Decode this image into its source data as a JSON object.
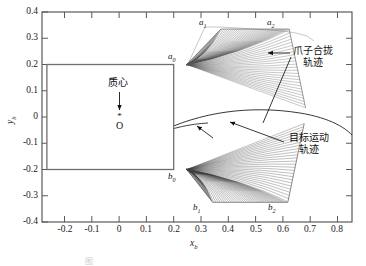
{
  "figure": {
    "caption": "图",
    "axes": {
      "xlabel": "x",
      "xlabel_sub": "b",
      "ylabel": "y",
      "ylabel_sub": "b",
      "xticks": [
        "-0.2",
        "-0.1",
        "0",
        "0.1",
        "0.2",
        "0.3",
        "0.4",
        "0.5",
        "0.6",
        "0.7",
        "0.8"
      ],
      "yticks": [
        "0.4",
        "0.3",
        "0.2",
        "0.1",
        "0",
        "-0.1",
        "-0.2",
        "-0.3",
        "-0.4"
      ],
      "xlim": [
        -0.28,
        0.855
      ],
      "ylim": [
        -0.4,
        0.4
      ],
      "frame_color": "#555555",
      "grid": false
    },
    "corner_labels": [
      {
        "name": "a0",
        "base": "a",
        "sub": "0",
        "x": 0.238,
        "y": 0.222
      },
      {
        "name": "a1",
        "base": "a",
        "sub": "1",
        "x": 0.355,
        "y": 0.352
      },
      {
        "name": "a2",
        "base": "a",
        "sub": "2",
        "x": 0.605,
        "y": 0.352
      },
      {
        "name": "b0",
        "base": "b",
        "sub": "0",
        "x": 0.238,
        "y": -0.238
      },
      {
        "name": "b1",
        "base": "b",
        "sub": "1",
        "x": 0.327,
        "y": -0.345
      },
      {
        "name": "b2",
        "base": "b",
        "sub": "2",
        "x": 0.598,
        "y": -0.345
      }
    ],
    "annotations": [
      {
        "name": "claw-closing-trajectory",
        "line1": "爪子合拢",
        "line2": "轨迹",
        "color": "#111111"
      },
      {
        "name": "target-motion-trajectory",
        "line1": "目标运动",
        "line2": "轨迹",
        "color": "#111111"
      },
      {
        "name": "center-of-mass",
        "line1": "质心",
        "line2": "",
        "color": "#111111"
      }
    ],
    "origin_marker": {
      "label": "O",
      "glyph": "*",
      "x": 0.0,
      "y": 0.0
    },
    "body_rect": {
      "name": "payload-body-rectangle",
      "x0": -0.25,
      "x1": 0.25,
      "y0": -0.2,
      "y1": 0.2,
      "stroke": "#6b6b6b"
    }
  },
  "chart_data": {
    "type": "line",
    "title": "",
    "subtitle": "",
    "xlabel": "x_b",
    "ylabel": "y_b",
    "xlim": [
      -0.28,
      0.855
    ],
    "ylim": [
      -0.4,
      0.4
    ],
    "xticks": [
      -0.2,
      -0.1,
      0,
      0.1,
      0.2,
      0.3,
      0.4,
      0.5,
      0.6,
      0.7,
      0.8
    ],
    "yticks": [
      -0.4,
      -0.3,
      -0.2,
      -0.1,
      0,
      0.1,
      0.2,
      0.3,
      0.4
    ],
    "grid": false,
    "legend": "none",
    "series": [
      {
        "name": "payload-body-rectangle",
        "type": "rectangle",
        "x": [
          -0.25,
          0.25,
          0.25,
          -0.25,
          -0.25
        ],
        "y": [
          0.2,
          0.2,
          -0.2,
          -0.2,
          0.2
        ],
        "color": "#6b6b6b"
      },
      {
        "name": "upper-claw-closing-surface",
        "type": "ruled-surface",
        "anchor_points": [
          {
            "label": "a0",
            "x": 0.25,
            "y": 0.2
          },
          {
            "label": "a1",
            "x": 0.375,
            "y": 0.335
          },
          {
            "label": "a2",
            "x": 0.625,
            "y": 0.335
          }
        ],
        "fan_origin": {
          "x": 0.25,
          "y": 0.2
        },
        "line_count": 90,
        "color": "#3a3a3a"
      },
      {
        "name": "lower-claw-closing-surface",
        "type": "ruled-surface",
        "anchor_points": [
          {
            "label": "b0",
            "x": 0.25,
            "y": -0.2
          },
          {
            "label": "b1",
            "x": 0.345,
            "y": -0.325
          },
          {
            "label": "b2",
            "x": 0.62,
            "y": -0.325
          }
        ],
        "fan_origin": {
          "x": 0.25,
          "y": -0.2
        },
        "line_count": 90,
        "color": "#2a2a2a"
      },
      {
        "name": "target-motion-trajectory",
        "type": "arc",
        "x": [
          0.29,
          0.4,
          0.52,
          0.64,
          0.76,
          0.855
        ],
        "y": [
          -0.055,
          0.015,
          0.045,
          0.04,
          0.0,
          -0.05
        ],
        "color": "#111111"
      },
      {
        "name": "target-motion-trajectory-inner",
        "type": "arc",
        "x": [
          0.29,
          0.37,
          0.45
        ],
        "y": [
          -0.06,
          -0.03,
          -0.02
        ],
        "color": "#111111"
      }
    ]
  }
}
